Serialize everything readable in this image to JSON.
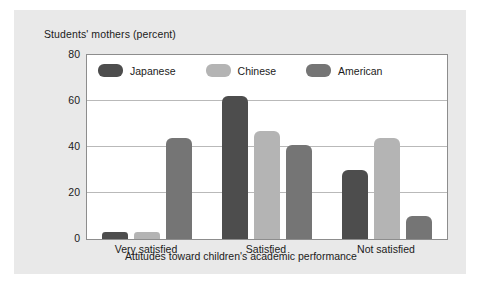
{
  "chart_data": {
    "type": "bar",
    "title": "",
    "ylabel": "Students' mothers (percent)",
    "xlabel": "Attitudes toward children's academic performance",
    "categories": [
      "Very satisfied",
      "Satisfied",
      "Not satisfied"
    ],
    "series": [
      {
        "name": "Japanese",
        "color": "#4d4d4d",
        "values": [
          3,
          62,
          30
        ]
      },
      {
        "name": "Chinese",
        "color": "#b4b4b4",
        "values": [
          3,
          47,
          44
        ]
      },
      {
        "name": "American",
        "color": "#757575",
        "values": [
          44,
          41,
          10
        ]
      }
    ],
    "ylim": [
      0,
      80
    ],
    "yticks": [
      "0",
      "20",
      "40",
      "60",
      "80"
    ],
    "grid": true,
    "legend_position": "top-left-inside"
  },
  "panel": {
    "background_color": "#e9e9e9",
    "plot_background_color": "#ffffff"
  }
}
